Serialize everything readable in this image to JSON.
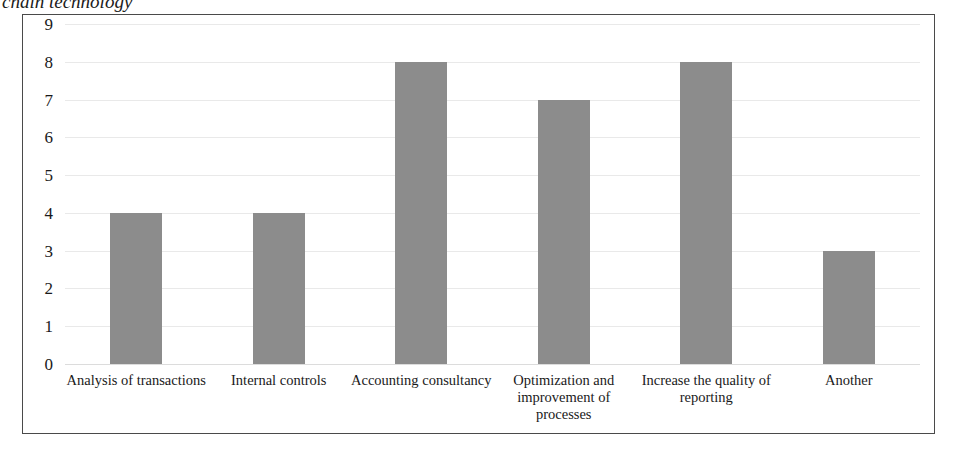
{
  "caption": {
    "text": "chain technology",
    "style": "italic-serif-clipped"
  },
  "chart_data": {
    "type": "bar",
    "title": "chain technology",
    "xlabel": "",
    "ylabel": "",
    "categories": [
      "Analysis of transactions",
      "Internal controls",
      "Accounting consultancy",
      "Optimization and improvement of processes",
      "Increase the quality of reporting",
      "Another"
    ],
    "values": [
      4,
      4,
      8,
      7,
      8,
      3
    ],
    "ylim": [
      0,
      9
    ],
    "yticks": [
      0,
      1,
      2,
      3,
      4,
      5,
      6,
      7,
      8,
      9
    ],
    "ytick_labels": [
      "0",
      "1",
      "2",
      "3",
      "4",
      "5",
      "6",
      "7",
      "8",
      "9"
    ],
    "grid": true,
    "grid_axis": "y",
    "legend": false,
    "bar_color": "#8c8c8c",
    "series": [
      {
        "name": "Responses",
        "values": [
          4,
          4,
          8,
          7,
          8,
          3
        ]
      }
    ]
  },
  "colors": {
    "bar": "#8c8c8c",
    "frame_border": "#4a4a4a",
    "gridline": "#e9e9e9",
    "text": "#1a1a1a",
    "background": "#ffffff"
  }
}
